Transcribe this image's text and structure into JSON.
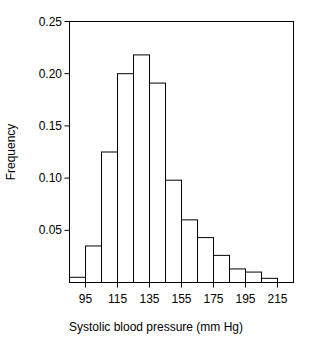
{
  "chart_data": {
    "type": "bar",
    "title": "",
    "subtitle": "",
    "xlabel": "Systolic blood pressure (mm Hg)",
    "ylabel": "Frequency",
    "grid": false,
    "legend": null,
    "xlim": [
      85,
      225
    ],
    "ylim": [
      0,
      0.25
    ],
    "x_ticks": [
      95,
      115,
      135,
      155,
      175,
      195,
      215
    ],
    "x_tick_labels": [
      "95",
      "115",
      "135",
      "155",
      "175",
      "195",
      "215"
    ],
    "y_ticks": [
      0.05,
      0.1,
      0.15,
      0.2,
      0.25
    ],
    "y_tick_labels": [
      "0.05",
      "0.10",
      "0.15",
      "0.20",
      "0.25"
    ],
    "bin_edges": [
      85,
      95,
      105,
      115,
      125,
      135,
      145,
      155,
      165,
      175,
      185,
      195,
      205,
      215,
      225
    ],
    "categories": [
      "85-95",
      "95-105",
      "105-115",
      "115-125",
      "125-135",
      "135-145",
      "145-155",
      "155-165",
      "165-175",
      "175-185",
      "185-195",
      "195-205",
      "205-215",
      "215-225"
    ],
    "values": [
      0.005,
      0.035,
      0.125,
      0.2,
      0.218,
      0.191,
      0.098,
      0.06,
      0.043,
      0.026,
      0.013,
      0.01,
      0.004,
      0.0
    ],
    "bar_color": "#ffffff",
    "bar_edge_color": "#000000",
    "axis_color": "#000000"
  },
  "axes": {
    "x_label": "Systolic blood pressure (mm Hg)",
    "y_label": "Frequency"
  }
}
